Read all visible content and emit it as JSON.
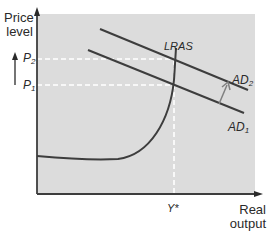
{
  "diagram": {
    "type": "AD-LRAS macroeconomic diagram",
    "y_axis_label": [
      "Price",
      "level"
    ],
    "x_axis_label": [
      "Real",
      "output"
    ],
    "price_levels": [
      {
        "base": "P",
        "sub": "2"
      },
      {
        "base": "P",
        "sub": "1"
      }
    ],
    "output_marker": "Y*",
    "curves": {
      "lras": "LRAS",
      "ad2": {
        "base": "AD",
        "sub": "2"
      },
      "ad1": {
        "base": "AD",
        "sub": "1"
      }
    },
    "annotations": [
      "Upward arrow beside price axis (P1 to P2)",
      "Arrow showing shift from AD1 to AD2"
    ],
    "colors": {
      "plot_background": "#dcdcdc",
      "line": "#3d3d3d",
      "arrow": "#808080",
      "guide": "#ffffff"
    }
  }
}
